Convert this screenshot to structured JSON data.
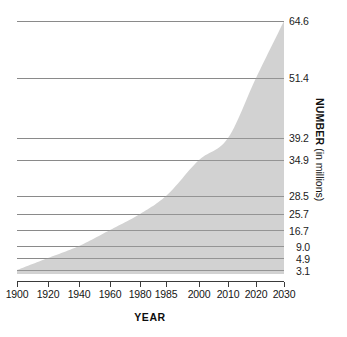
{
  "chart_data": {
    "type": "area",
    "title": "",
    "xlabel": "YEAR",
    "ylabel": "NUMBER (in millions)",
    "ylabel_bold_part": "NUMBER",
    "ylabel_regular_part": "(in millions)",
    "grid": true,
    "legend": "none",
    "xlim": [
      1900,
      2030
    ],
    "ylim": [
      0,
      64.6
    ],
    "x": [
      1900,
      1920,
      1940,
      1960,
      1980,
      1985,
      2000,
      2010,
      2020,
      2030
    ],
    "values": [
      3.1,
      4.9,
      9.0,
      16.7,
      25.7,
      28.5,
      34.9,
      39.2,
      51.4,
      64.6
    ],
    "categories": [
      "1900",
      "1920",
      "1940",
      "1960",
      "1980",
      "1985",
      "2000",
      "2010",
      "2020",
      "2030"
    ],
    "xtick_labels": [
      "1900",
      "1920",
      "1940",
      "1960",
      "1980",
      "1985",
      "2000",
      "2010",
      "2020",
      "2030"
    ],
    "ytick_labels": [
      "64.6",
      "51.4",
      "39.2",
      "34.9",
      "28.5",
      "25.7",
      "16.7",
      "9.0",
      "4.9",
      "3.1"
    ],
    "ytick_values": [
      64.6,
      51.4,
      39.2,
      34.9,
      28.5,
      25.7,
      16.7,
      9.0,
      4.9,
      3.1
    ],
    "series": [
      {
        "name": "Number (in millions)",
        "values": [
          3.1,
          4.9,
          9.0,
          16.7,
          25.7,
          28.5,
          34.9,
          39.2,
          51.4,
          64.6
        ]
      }
    ],
    "colors": {
      "area_fill": "#d2d2d2",
      "gridline": "#8e8e8e",
      "axis": "#3a3a3a",
      "text": "#151515",
      "background": "#ffffff"
    },
    "geometry": {
      "plot_left": 17,
      "plot_right": 284,
      "plot_top": 18,
      "plot_bottom": 281,
      "ytick_pixel_y": [
        21,
        78,
        138,
        160,
        196,
        214,
        230,
        246,
        258,
        270
      ],
      "xtick_pixel_x": [
        17,
        48,
        79,
        110,
        140,
        166,
        199,
        228,
        256,
        284
      ]
    }
  }
}
